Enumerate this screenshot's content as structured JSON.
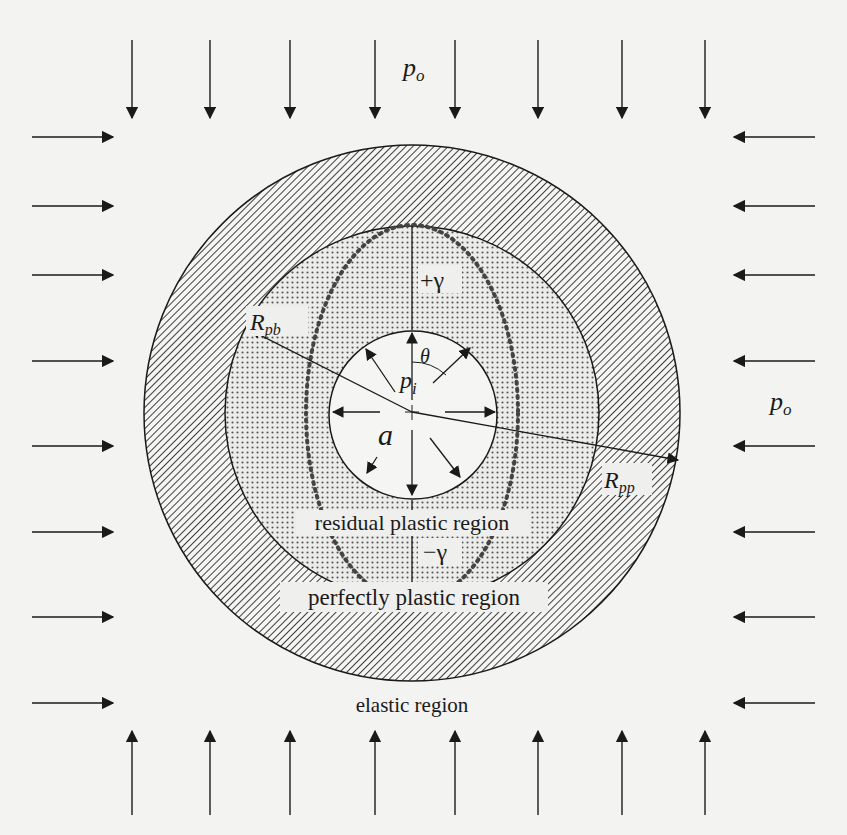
{
  "figure": {
    "labels": {
      "outer_pressure_top": "p",
      "outer_pressure_top_sub": "o",
      "outer_pressure_right": "p",
      "outer_pressure_right_sub": "o",
      "inner_pressure": "p",
      "inner_pressure_sub": "i",
      "radius_a": "a",
      "angle": "θ",
      "plus_gamma": "+γ",
      "minus_gamma": "−γ",
      "radius_pb": "R",
      "radius_pb_sub": "pb",
      "radius_pp": "R",
      "radius_pp_sub": "pp"
    },
    "regions": {
      "residual": "residual plastic region",
      "perfect": "perfectly plastic region",
      "elastic": "elastic region"
    },
    "geometry": {
      "center": [
        412,
        413
      ],
      "outer_radius": 268,
      "middle_radius": 187,
      "inner_radius": 84,
      "ellipse_rx": 106,
      "ellipse_ry": 188
    },
    "arrows": {
      "top_x": [
        132,
        210,
        290,
        375,
        455,
        538,
        622,
        705
      ],
      "side_y": [
        137,
        206,
        275,
        361,
        446,
        532,
        617,
        703
      ]
    },
    "colors": {
      "ink": "#1a1a1a",
      "paper": "#f3f3f1"
    }
  }
}
